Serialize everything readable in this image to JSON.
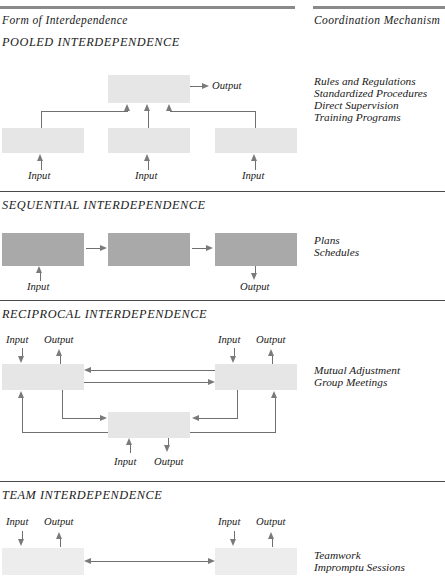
{
  "headers": {
    "left": "Form of Interdependence",
    "right": "Coordination  Mechanism"
  },
  "labels": {
    "input": "Input",
    "output": "Output"
  },
  "sections": [
    {
      "id": "pooled",
      "title": "POOLED INTERDEPENDENCE",
      "mechanisms": [
        "Rules and Regulations",
        "Standardized Procedures",
        "Direct Supervision",
        "Training Programs"
      ],
      "box_fill": "#e6e6e6",
      "inputs": [
        "Input",
        "Input",
        "Input"
      ],
      "outputs": [
        "Output"
      ]
    },
    {
      "id": "sequential",
      "title": "SEQUENTIAL INTERDEPENDENCE",
      "mechanisms": [
        "Plans",
        "Schedules"
      ],
      "box_fill": "#a9a9a9",
      "inputs": [
        "Input"
      ],
      "outputs": [
        "Output"
      ]
    },
    {
      "id": "reciprocal",
      "title": "RECIPROCAL INTERDEPENDENCE",
      "mechanisms": [
        "Mutual Adjustment",
        "Group Meetings"
      ],
      "box_fill": "#e6e6e6",
      "inputs": [
        "Input",
        "Input",
        "Input"
      ],
      "outputs": [
        "Output",
        "Output",
        "Output"
      ]
    },
    {
      "id": "team",
      "title": "TEAM INTERDEPENDENCE",
      "mechanisms": [
        "Teamwork",
        "Impromptu Sessions"
      ],
      "box_fill": "#ededed",
      "inputs": [
        "Input",
        "Input"
      ],
      "outputs": [
        "Output",
        "Output"
      ]
    }
  ],
  "colors": {
    "rule": "#8a8a8a",
    "divider": "#4a4a4a",
    "connector": "#70706e",
    "text": "#1a1a1a"
  }
}
